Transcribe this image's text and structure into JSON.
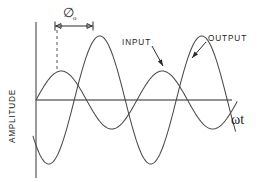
{
  "figure": {
    "width": 259,
    "height": 182,
    "background": "#ffffff",
    "stroke_color": "#4a4a4a",
    "axis_color": "#6f6f6f",
    "text_color": "#1d1d1d"
  },
  "labels": {
    "y_axis": "AMPLITUDE",
    "x_axis": "ωt",
    "x_axis_omega": "ω",
    "x_axis_t": "t",
    "input": "INPUT",
    "output": "OUTPUT",
    "phase": "∅",
    "phase_subscript": "o"
  },
  "geometry": {
    "origin_x": 36,
    "origin_y": 100,
    "y_axis_top": 22,
    "y_axis_bottom": 178,
    "x_axis_right": 232,
    "dimension_line_y": 26,
    "dimension_line_x1": 55,
    "dimension_line_x2": 93,
    "dash_line_x": 57,
    "dash_line_y1": 30,
    "dash_line_y2": 72,
    "input_leader_x1": 152,
    "input_leader_y1": 46,
    "input_leader_x2": 163,
    "input_leader_y2": 66,
    "output_leader_x1": 206,
    "output_leader_y1": 42,
    "output_leader_x2": 192,
    "output_leader_y2": 58,
    "amplitude_label_x": 15,
    "amplitude_label_y": 116,
    "omega_label_x": 231,
    "omega_label_y": 124,
    "phase_label_x": 68,
    "phase_label_y": 17,
    "input_label_x": 122,
    "input_label_y": 45,
    "output_label_x": 208,
    "output_label_y": 41
  },
  "chart_data": {
    "type": "line",
    "title": "",
    "xlabel": "ωt",
    "ylabel": "AMPLITUDE",
    "grid": false,
    "legend": "inline-annotations",
    "xlim": [
      0,
      232
    ],
    "ylim": [
      -70,
      70
    ],
    "annotations": [
      {
        "text": "∅o",
        "kind": "phase-shift-dimension",
        "from_x": 55,
        "to_x": 93
      },
      {
        "text": "INPUT",
        "kind": "curve-callout",
        "series": "INPUT"
      },
      {
        "text": "OUTPUT",
        "kind": "curve-callout",
        "series": "OUTPUT"
      }
    ],
    "series": [
      {
        "name": "INPUT",
        "amplitude": 29,
        "period": 101,
        "phase_deg": 0,
        "start_x": 36,
        "end_x": 237,
        "zero_crossings": [
          36,
          87,
          137,
          188,
          237
        ],
        "peaks": [
          {
            "x": 57,
            "y": 71
          },
          {
            "x": 162,
            "y": 71
          }
        ],
        "troughs": [
          {
            "x": 112,
            "y": 129
          },
          {
            "x": 213,
            "y": 129
          }
        ]
      },
      {
        "name": "OUTPUT",
        "amplitude": 64,
        "period": 102,
        "phase_deg": 225,
        "start_x": 33,
        "end_x": 236,
        "zero_crossings": [
          42,
          93,
          144,
          195
        ],
        "peaks": [
          {
            "x": 93,
            "y": 36
          },
          {
            "x": 195,
            "y": 36
          }
        ],
        "troughs": [
          {
            "x": 42,
            "y": 164
          },
          {
            "x": 144,
            "y": 164
          }
        ]
      }
    ]
  }
}
